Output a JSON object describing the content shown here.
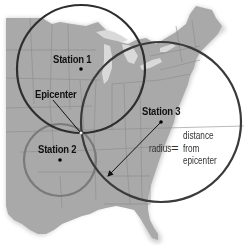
{
  "diagram": {
    "map_color": "#a9a9a9",
    "lake_color": "#d9d9d9",
    "circle_color_dark": "#2e2e2e",
    "circle_color_light": "#7a7a7a",
    "stations": [
      {
        "id": "station-1",
        "label": "Station 1",
        "x": 81,
        "y": 69,
        "radius": 64
      },
      {
        "id": "station-2",
        "label": "Station 2",
        "x": 60,
        "y": 160,
        "radius": 36
      },
      {
        "id": "station-3",
        "label": "Station 3",
        "x": 161,
        "y": 122,
        "radius": 80
      }
    ],
    "epicenter": {
      "label": "Epicenter",
      "x": 81,
      "y": 133
    },
    "annotation": {
      "radius_label": "radius",
      "equals": "=",
      "distance_lines": [
        "distance",
        "from",
        "epicenter"
      ]
    }
  }
}
